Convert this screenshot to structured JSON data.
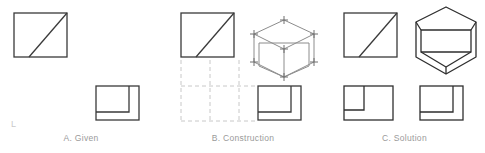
{
  "figure": {
    "title_visible": false,
    "background_color": "#ffffff",
    "line_color": "#3a3a3a",
    "construction_line_color": "#c8c8c8",
    "caption_color": "#9a9a9a",
    "corner_mark": "L"
  },
  "panels": [
    {
      "id": "a",
      "caption": "A. Given",
      "views": [
        {
          "name": "top-view",
          "shape": "rectangle-with-diagonal",
          "description": "Rectangle with diagonal from lower-left to upper-right"
        },
        {
          "name": "front-view",
          "shape": "rectangle-with-inner-l-step",
          "description": "Rectangle with inner offset rectangle forming an L step"
        }
      ]
    },
    {
      "id": "b",
      "caption": "B. Construction",
      "views": [
        {
          "name": "top-view",
          "shape": "rectangle-with-diagonal",
          "description": "Rectangle with diagonal from lower-left to upper-right"
        },
        {
          "name": "construction-grid",
          "shape": "dashed-projection-grid",
          "description": "Dashed vertical and horizontal projection lines"
        },
        {
          "name": "isometric-construction-box",
          "shape": "isometric-box-with-vertex-marks",
          "description": "Isometric enclosing box with plus tick marks at vertices"
        },
        {
          "name": "front-view",
          "shape": "rectangle-with-inner-l-step",
          "description": "Rectangle with inner offset rectangle forming an L step"
        }
      ]
    },
    {
      "id": "c",
      "caption": "C. Solution",
      "views": [
        {
          "name": "top-view",
          "shape": "rectangle-with-diagonal",
          "description": "Rectangle with diagonal from lower-left to upper-right"
        },
        {
          "name": "isometric-solution",
          "shape": "isometric-cut-solid",
          "description": "Isometric hexagonal outline with inner sloped cut face"
        },
        {
          "name": "front-view-left",
          "shape": "rectangle-with-inner-l-step",
          "description": "Rectangle with inner offset rectangle forming an L step"
        },
        {
          "name": "front-view-right",
          "shape": "rectangle-with-inner-l-step",
          "description": "Rectangle with inner offset rectangle forming an L step"
        }
      ]
    }
  ]
}
